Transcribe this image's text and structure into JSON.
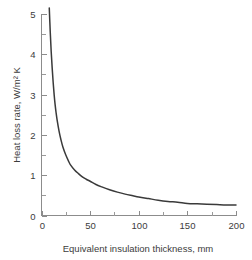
{
  "chart_data": {
    "type": "line",
    "title": "",
    "subtitle": "",
    "xlabel": "Equivalent insulation thickness, mm",
    "ylabel": "Heat loss rate, W/m² K",
    "xlim": [
      0,
      200
    ],
    "ylim": [
      0,
      5
    ],
    "grid": false,
    "legend": null,
    "legend_position": "none",
    "x_major_ticks": [
      0,
      50,
      100,
      150,
      200
    ],
    "x_major_tick_labels": [
      "0",
      "50",
      "100",
      "150",
      "200"
    ],
    "x_minor_ticks": [
      25,
      75,
      125,
      175
    ],
    "y_major_ticks": [
      0,
      1,
      2,
      3,
      4,
      5
    ],
    "y_major_tick_labels": [
      "0",
      "1",
      "2",
      "3",
      "4",
      "5"
    ],
    "y_minor_ticks": [
      0.5,
      1.5,
      2.5,
      3.5,
      4.5
    ],
    "line_color": "#3a3a3a",
    "axis_color": "#8c8c8c",
    "background_color": "#ffffff",
    "series": [
      {
        "name": "Heat loss rate",
        "color": "#3a3a3a",
        "x": [
          8,
          9,
          10,
          11,
          12,
          13,
          14,
          15,
          16,
          18,
          20,
          22,
          25,
          28,
          30,
          34,
          38,
          42,
          46,
          50,
          56,
          62,
          70,
          78,
          86,
          94,
          100,
          110,
          120,
          130,
          140,
          150,
          160,
          170,
          180,
          190,
          200
        ],
        "y": [
          5.15,
          4.55,
          4.05,
          3.65,
          3.3,
          3.0,
          2.75,
          2.55,
          2.38,
          2.1,
          1.88,
          1.7,
          1.5,
          1.34,
          1.25,
          1.13,
          1.04,
          0.96,
          0.9,
          0.85,
          0.77,
          0.71,
          0.64,
          0.58,
          0.53,
          0.49,
          0.46,
          0.42,
          0.38,
          0.35,
          0.33,
          0.3,
          0.29,
          0.28,
          0.27,
          0.26,
          0.26
        ]
      }
    ]
  },
  "axes": {
    "x_title": "Equivalent insulation thickness, mm",
    "y_title": "Heat loss rate, W/m² K"
  }
}
